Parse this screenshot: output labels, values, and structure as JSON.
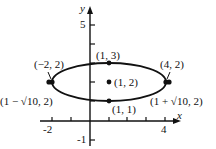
{
  "figure": {
    "type": "ellipse-plot",
    "axes": {
      "x_label": "x",
      "y_label": "y",
      "x_ticks": [
        "-2",
        "4"
      ],
      "y_ticks": [
        "5",
        "-1"
      ]
    },
    "points": [
      {
        "id": "left-vertex",
        "label": "(−2, 2)",
        "x": -2,
        "y": 2
      },
      {
        "id": "top",
        "label": "(1, 3)",
        "x": 1,
        "y": 3
      },
      {
        "id": "right-vertex",
        "label": "(4, 2)",
        "x": 4,
        "y": 2
      },
      {
        "id": "center",
        "label": "(1, 2)",
        "x": 1,
        "y": 2
      },
      {
        "id": "bottom",
        "label": "(1, 1)",
        "x": 1,
        "y": 1
      },
      {
        "id": "left-focus",
        "label": "(1 − √10, 2)",
        "x": -2.162,
        "y": 2
      },
      {
        "id": "right-focus",
        "label": "(1 + √10, 2)",
        "x": 4.162,
        "y": 2
      }
    ],
    "ellipse": {
      "center": [
        1,
        2
      ],
      "semi_major": 3,
      "semi_minor": 1
    },
    "colors": {
      "ink": "#111111",
      "background": "#ffffff"
    }
  }
}
